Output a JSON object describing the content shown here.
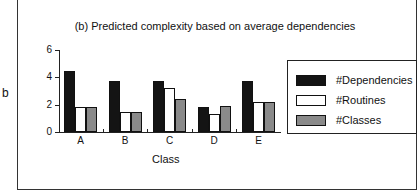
{
  "side_label": "b",
  "chart_data": {
    "type": "bar",
    "title": "(b) Predicted complexity based on average dependencies",
    "xlabel": "Class",
    "ylabel": "",
    "ylim": [
      0,
      6
    ],
    "yticks": [
      0,
      2,
      4,
      6
    ],
    "categories": [
      "A",
      "B",
      "C",
      "D",
      "E"
    ],
    "series": [
      {
        "name": "#Dependencies",
        "color": "#141414",
        "values": [
          4.5,
          3.7,
          3.7,
          1.8,
          3.7
        ]
      },
      {
        "name": "#Routines",
        "color": "#ffffff",
        "values": [
          1.8,
          1.5,
          3.2,
          1.3,
          2.2
        ]
      },
      {
        "name": "#Classes",
        "color": "#8a8a8a",
        "values": [
          1.8,
          1.5,
          2.4,
          1.9,
          2.2
        ]
      }
    ],
    "grid": false,
    "legend_position": "right"
  }
}
